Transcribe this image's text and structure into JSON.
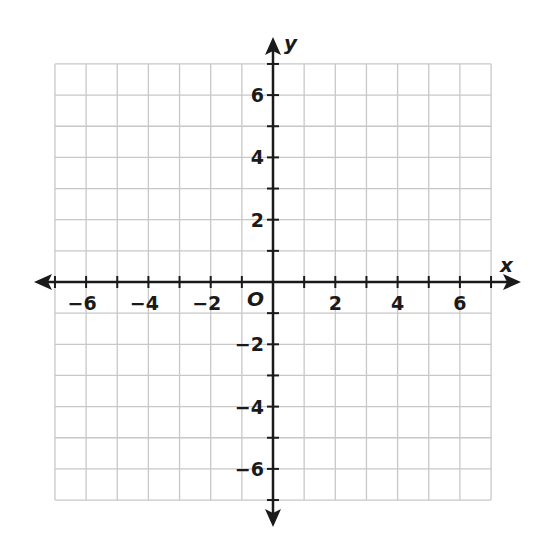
{
  "figure": {
    "type": "coordinate-plane",
    "x_axis_label": "x",
    "y_axis_label": "y",
    "origin_label": "O",
    "x_range": [
      -7,
      7
    ],
    "y_range": [
      -7,
      7
    ],
    "grid_step": 1,
    "label_step": 2,
    "x_tick_labels": [
      "−6",
      "−4",
      "−2",
      "2",
      "4",
      "6"
    ],
    "x_tick_values": [
      -6,
      -4,
      -2,
      2,
      4,
      6
    ],
    "y_tick_labels": [
      "6",
      "4",
      "2",
      "−2",
      "−4",
      "−6"
    ],
    "y_tick_values": [
      6,
      4,
      2,
      -2,
      -4,
      -6
    ],
    "colors": {
      "grid": "#c8c8c8",
      "axis": "#1a1a1a",
      "background": "#ffffff"
    }
  }
}
